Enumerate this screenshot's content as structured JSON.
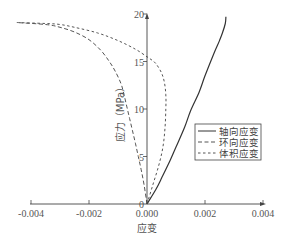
{
  "chart_data": {
    "type": "line",
    "title": "",
    "xlabel": "应变",
    "ylabel": "应力（MPa）",
    "xlim": [
      -0.004,
      0.004
    ],
    "ylim": [
      0,
      20
    ],
    "xticks": [
      -0.004,
      -0.002,
      0.0,
      0.002,
      0.004
    ],
    "xtick_labels": [
      "-0.004",
      "-0.002",
      "0.000",
      "0.002",
      "0.004"
    ],
    "yticks": [
      0,
      5,
      10,
      15,
      20
    ],
    "ytick_labels": [
      "0",
      "5",
      "10",
      "15",
      "20"
    ],
    "grid": false,
    "legend_position": "right-middle",
    "series": [
      {
        "name": "轴向应变",
        "style": "solid",
        "color": "#333333",
        "x": [
          0.0,
          0.0003,
          0.0005,
          0.0008,
          0.001,
          0.0013,
          0.0015,
          0.0018,
          0.002,
          0.0023,
          0.0025,
          0.0026,
          0.0027,
          0.00272
        ],
        "y": [
          0.0,
          1.5,
          2.7,
          4.6,
          6.0,
          8.1,
          9.8,
          11.8,
          13.5,
          15.8,
          17.2,
          18.0,
          19.0,
          19.7
        ]
      },
      {
        "name": "环向应变",
        "style": "dashed",
        "color": "#555555",
        "x": [
          0.0,
          -0.0001,
          -0.0002,
          -0.0003,
          -0.0004,
          -0.0005,
          -0.0006,
          -0.0007,
          -0.0008,
          -0.0009,
          -0.0011,
          -0.0013,
          -0.0016,
          -0.002,
          -0.0025,
          -0.003,
          -0.0035,
          -0.0045
        ],
        "y": [
          0.0,
          2.0,
          3.6,
          5.0,
          6.4,
          7.7,
          9.0,
          10.3,
          11.6,
          12.7,
          14.0,
          15.0,
          16.2,
          17.3,
          18.1,
          18.6,
          18.9,
          19.1
        ]
      },
      {
        "name": "体积应变",
        "style": "dotted",
        "color": "#555555",
        "x": [
          0.0,
          0.0002,
          0.0004,
          0.00055,
          0.00062,
          0.00065,
          0.00065,
          0.0006,
          0.0005,
          0.0003,
          0.0001,
          0.0,
          -0.0004,
          -0.001,
          -0.0017,
          -0.0025,
          -0.003,
          -0.0035,
          -0.0045
        ],
        "y": [
          0.0,
          2.0,
          4.0,
          6.0,
          8.0,
          10.0,
          11.5,
          12.8,
          13.8,
          14.8,
          15.3,
          15.5,
          16.3,
          17.2,
          18.0,
          18.6,
          18.9,
          19.0,
          19.1
        ]
      }
    ]
  },
  "legend": {
    "items": [
      {
        "label": "轴向应变",
        "style": "solid"
      },
      {
        "label": "环向应变",
        "style": "dashed"
      },
      {
        "label": "体积应变",
        "style": "dotted"
      }
    ]
  }
}
